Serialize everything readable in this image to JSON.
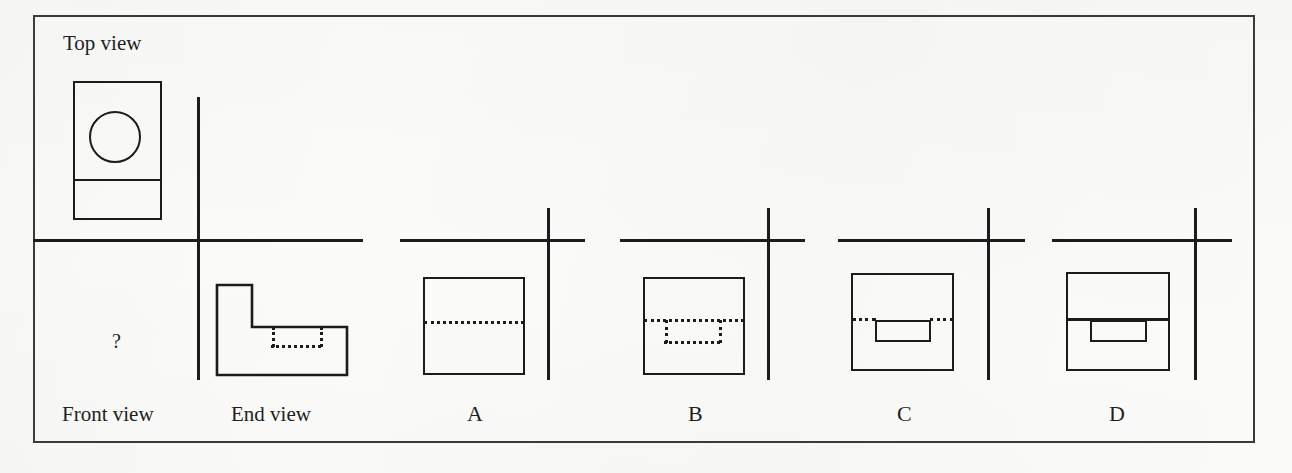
{
  "figure": {
    "kind": "orthographic-projection-exercise",
    "background_color": "#fbfbf9",
    "ink_color": "#1c1c1c",
    "frame_color": "#3a3a3a",
    "question_mark": "?",
    "labels": {
      "top_view": "Top view",
      "front_view": "Front view",
      "end_view": "End view",
      "option_a": "A",
      "option_b": "B",
      "option_c": "C",
      "option_d": "D"
    }
  },
  "given_views": {
    "top_view": {
      "label": "Top view",
      "outline": {
        "x": 73,
        "y": 81,
        "w": 89,
        "h": 139
      },
      "divider_line_y": 180,
      "circle": {
        "cx": 115,
        "cy": 137,
        "r": 26
      }
    },
    "end_view": {
      "label": "End view",
      "profile": "L-shape",
      "points": "217,285 252,285 252,327 347,327 347,375 217,375",
      "hidden_rect": {
        "x": 272,
        "y": 327,
        "w": 48,
        "h": 19
      }
    },
    "front_view": {
      "label": "Front view",
      "content": "?",
      "marker_x": 117,
      "marker_y": 340
    }
  },
  "axes": [
    {
      "name": "given-axis",
      "h_x1": 33,
      "h_x2": 363,
      "h_y": 240,
      "v_x": 198,
      "v_y1": 97,
      "v_y2": 380
    },
    {
      "name": "option-a-axis",
      "h_x1": 400,
      "h_x2": 585,
      "h_y": 240,
      "v_x": 548,
      "v_y1": 208,
      "v_y2": 380
    },
    {
      "name": "option-b-axis",
      "h_x1": 620,
      "h_x2": 805,
      "h_y": 240,
      "v_x": 768,
      "v_y1": 208,
      "v_y2": 380
    },
    {
      "name": "option-c-axis",
      "h_x1": 838,
      "h_x2": 1025,
      "h_y": 240,
      "v_x": 988,
      "v_y1": 208,
      "v_y2": 380
    },
    {
      "name": "option-d-axis",
      "h_x1": 1052,
      "h_x2": 1232,
      "h_y": 240,
      "v_x": 1195,
      "v_y1": 208,
      "v_y2": 380
    }
  ],
  "options": [
    {
      "id": "A",
      "label": "A",
      "label_x": 474,
      "label_y": 405,
      "outline": {
        "x": 423,
        "y": 277,
        "w": 102,
        "h": 98
      },
      "hidden_horizontal": {
        "x": 423,
        "y": 322,
        "w": 102
      },
      "hidden_pocket": null,
      "solid_horizontal": null,
      "solid_pocket": null
    },
    {
      "id": "B",
      "label": "B",
      "label_x": 694,
      "label_y": 405,
      "outline": {
        "x": 643,
        "y": 277,
        "w": 102,
        "h": 98
      },
      "hidden_horizontal": {
        "x": 643,
        "y": 320,
        "w": 102
      },
      "hidden_pocket": {
        "x": 665,
        "y": 320,
        "w": 54,
        "h": 22
      },
      "solid_horizontal": null,
      "solid_pocket": null
    },
    {
      "id": "C",
      "label": "C",
      "label_x": 903,
      "label_y": 405,
      "outline": {
        "x": 851,
        "y": 273,
        "w": 103,
        "h": 98
      },
      "hidden_horizontal_segments": [
        {
          "x": 851,
          "y": 319,
          "w": 26
        },
        {
          "x": 929,
          "y": 319,
          "w": 25
        }
      ],
      "hidden_pocket": null,
      "solid_horizontal": null,
      "solid_pocket": {
        "x": 875,
        "y": 320,
        "w": 56,
        "h": 22
      }
    },
    {
      "id": "D",
      "label": "D",
      "label_x": 1116,
      "label_y": 405,
      "outline": {
        "x": 1066,
        "y": 272,
        "w": 104,
        "h": 99
      },
      "hidden_horizontal": null,
      "hidden_pocket": null,
      "solid_horizontal": {
        "x": 1066,
        "y": 319,
        "w": 104
      },
      "solid_pocket": {
        "x": 1090,
        "y": 320,
        "w": 57,
        "h": 22
      }
    }
  ]
}
